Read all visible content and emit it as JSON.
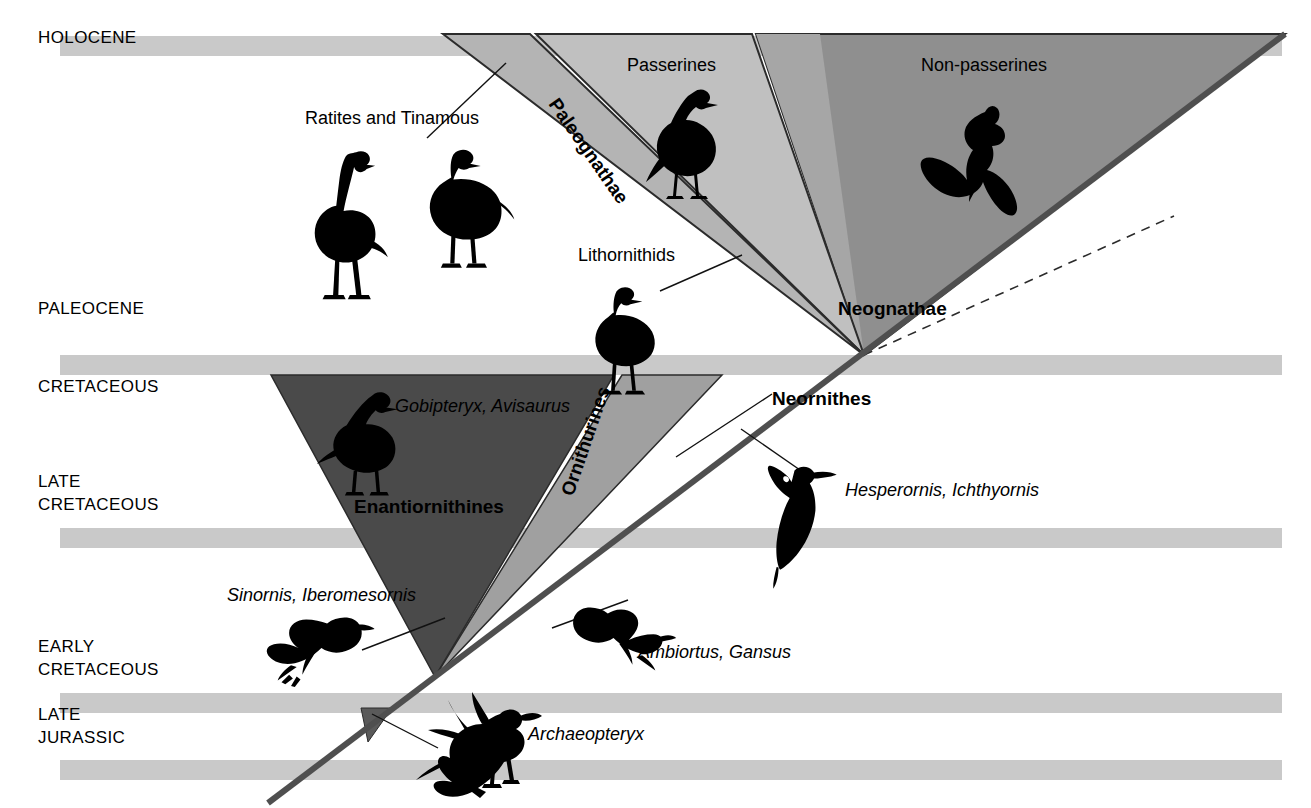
{
  "figure": {
    "type": "phylogeny-timeline-diagram",
    "background": "#ffffff",
    "width": 1311,
    "height": 808
  },
  "colors": {
    "band": "#c9c9c9",
    "paleognathae_wedge": "#b4b4b4",
    "passerines_wedge": "#c0c0c0",
    "nonpasserines_wedge": "#8f8f8f",
    "neognathae_wedge": "#a6a6a6",
    "enantiornithines_wedge": "#4a4a4a",
    "ornithurines_wedge": "#a0a0a0",
    "stem_line": "#4f4f4f",
    "outline": "#2b2b2b",
    "text": "#000000"
  },
  "time_axis": {
    "name": "geologic-time-axis",
    "eras": [
      {
        "id": "holocene",
        "lines": [
          "HOLOCENE"
        ],
        "label_y": 36,
        "band_y": 36,
        "band_h": 20
      },
      {
        "id": "paleocene",
        "lines": [
          "PALEOCENE"
        ],
        "label_y": 307,
        "band_y": 355,
        "band_h": 20
      },
      {
        "id": "cretaceous",
        "lines": [
          "CRETACEOUS"
        ],
        "label_y": 385,
        "band_y": null,
        "band_h": 0
      },
      {
        "id": "late-cretaceous",
        "lines": [
          "LATE",
          "CRETACEOUS"
        ],
        "label_y": 480,
        "band_y": 528,
        "band_h": 20
      },
      {
        "id": "early-cretaceous",
        "lines": [
          "EARLY",
          "CRETACEOUS"
        ],
        "label_y": 645,
        "band_y": 693,
        "band_h": 20
      },
      {
        "id": "late-jurassic",
        "lines": [
          "LATE",
          "JURASSIC"
        ],
        "label_y": 713,
        "band_y": 760,
        "band_h": 20
      }
    ],
    "band_x": 60,
    "band_x2": 1282
  },
  "clades": [
    {
      "id": "paleognathae",
      "label": "Paleognathae",
      "style": "bold-rotated",
      "rotation": 55,
      "x": 548,
      "y": 104
    },
    {
      "id": "neognathae",
      "label": "Neognathae",
      "style": "bold",
      "rotation": 0,
      "x": 838,
      "y": 315
    },
    {
      "id": "neornithes",
      "label": "Neornithes",
      "style": "bold",
      "rotation": 0,
      "x": 772,
      "y": 405
    },
    {
      "id": "enantiornithines",
      "label": "Enantiornithines",
      "style": "bold",
      "rotation": 0,
      "x": 354,
      "y": 513
    },
    {
      "id": "ornithurines",
      "label": "Ornithurines",
      "style": "bold-rotated",
      "rotation": -71,
      "x": 573,
      "y": 497
    }
  ],
  "group_labels": [
    {
      "id": "ratites-and-tinamous",
      "label": "Ratites and Tinamous",
      "x": 305,
      "y": 124
    },
    {
      "id": "passerines",
      "label": "Passerines",
      "x": 627,
      "y": 71
    },
    {
      "id": "non-passerines",
      "label": "Non-passerines",
      "x": 921,
      "y": 71
    },
    {
      "id": "lithornithids",
      "label": "Lithornithids",
      "x": 578,
      "y": 261
    }
  ],
  "taxa_labels": [
    {
      "id": "gobipteryx-avisaurus",
      "label": "Gobipteryx, Avisaurus",
      "x": 395,
      "y": 412
    },
    {
      "id": "hesperornis-ichthyornis",
      "label": "Hesperornis, Ichthyornis",
      "x": 845,
      "y": 496
    },
    {
      "id": "sinornis-iberomesornis",
      "label": "Sinornis, Iberomesornis",
      "x": 227,
      "y": 601
    },
    {
      "id": "ambiortus-gansus",
      "label": "Ambiortus, Gansus",
      "x": 638,
      "y": 658
    },
    {
      "id": "archaeopteryx",
      "label": "Archaeopteryx",
      "x": 528,
      "y": 740
    }
  ],
  "silhouettes": [
    {
      "id": "ostrich-silhouette",
      "depicts": "ratite-standing-long-neck"
    },
    {
      "id": "tinamou-silhouette",
      "depicts": "tinamou-standing"
    },
    {
      "id": "passerine-silhouette",
      "depicts": "perching-songbird"
    },
    {
      "id": "raptor-silhouette",
      "depicts": "soaring-bird-of-prey"
    },
    {
      "id": "lithornithid-silhouette",
      "depicts": "lithornithid-standing"
    },
    {
      "id": "gobipteryx-silhouette",
      "depicts": "enantiornithine-standing"
    },
    {
      "id": "hesperornis-silhouette",
      "depicts": "diving-foot-propelled-bird"
    },
    {
      "id": "sinornis-silhouette",
      "depicts": "small-flying-bird-left"
    },
    {
      "id": "ambiortus-silhouette",
      "depicts": "small-flying-bird-right"
    },
    {
      "id": "archaeopteryx-silhouette",
      "depicts": "archaeopteryx-running-feathered"
    }
  ]
}
